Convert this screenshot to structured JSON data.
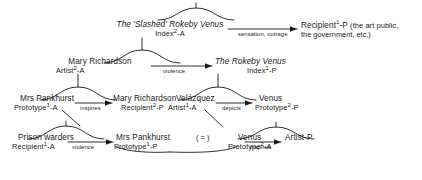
{
  "diagram": {
    "nodes": [
      {
        "id": "slashed-rokeby-venus",
        "title": "The 'Slashed' Rokeby Venus",
        "role_text": "Index",
        "role_sup": "2",
        "role_suffix": "-A",
        "role_full": "Index 2-A"
      },
      {
        "id": "recipient-1-p",
        "title": "Recipient",
        "title_sup": "1",
        "title_suffix": "-P",
        "title_full": "Recipient1-P",
        "note": "(the art public,",
        "note2": "the government, etc.)"
      },
      {
        "id": "mary-richardson-artist",
        "title": "Mary Richardson",
        "role_text": "Artist",
        "role_sup": "2",
        "role_suffix": "-A",
        "role_full": "Artist 2-A"
      },
      {
        "id": "rokeby-venus",
        "title": "The Rokeby Venus",
        "role_text": "Index",
        "role_sup": "1",
        "role_suffix": "-P",
        "role_full": "Index 1-P"
      },
      {
        "id": "mrs-pankhurst-prototype-1a",
        "title": "Mrs Pankhurst",
        "role_text": "Prototype",
        "role_sup": "1",
        "role_suffix": "-A",
        "role_full": "Prototype 1-A"
      },
      {
        "id": "mary-richardson-recipient",
        "title": "Mary Richardson",
        "role_text": "Recipient",
        "role_sup": "2",
        "role_suffix": "-P",
        "role_full": "Recipient 2-P"
      },
      {
        "id": "velazquez",
        "title": "Velázquez",
        "role_text": "Artist",
        "role_sup": "1",
        "role_suffix": "-A",
        "role_full": "Artist 1-A"
      },
      {
        "id": "venus-prototype-2p",
        "title": "Venus",
        "role_text": "Prototype",
        "role_sup": "2",
        "role_suffix": "-P",
        "role_full": "Prototype 2-P"
      },
      {
        "id": "prison-warders",
        "title": "Prison warders",
        "role_text": "Recipient",
        "role_sup": "1",
        "role_suffix": "-A",
        "role_full": "Recipient 1-A"
      },
      {
        "id": "mrs-pankhurst-prototype-1p",
        "title": "Mrs Pankhurst",
        "role_text": "Prototype",
        "role_sup": "1",
        "role_suffix": "-P",
        "role_full": "Prototype 1-P"
      },
      {
        "id": "venus-prototype-2a",
        "title": "Venus",
        "role_text": "Prototype",
        "role_sup": "2",
        "role_suffix": "-A",
        "role_full": "Prototype 2-A"
      },
      {
        "id": "artist-p",
        "title": "Artist-P",
        "role_text": "",
        "role_full": ""
      }
    ],
    "edges": [
      {
        "id": "edge-sensation-outrage",
        "label": "sensation, outrage",
        "from": "slashed-rokeby-venus",
        "to": "recipient-1-p"
      },
      {
        "id": "edge-violence-top",
        "label": "violence",
        "from": "mary-richardson-artist",
        "to": "rokeby-venus"
      },
      {
        "id": "edge-inspires-mid",
        "label": "inspires",
        "from": "mrs-pankhurst-prototype-1a",
        "to": "mary-richardson-recipient"
      },
      {
        "id": "edge-depicts",
        "label": "depicts",
        "from": "velazquez",
        "to": "venus-prototype-2p"
      },
      {
        "id": "edge-violence-bottom",
        "label": "violence",
        "from": "prison-warders",
        "to": "mrs-pankhurst-prototype-1p"
      },
      {
        "id": "edge-inspires-bottom",
        "label": "inspires",
        "from": "venus-prototype-2a",
        "to": "artist-p"
      }
    ],
    "equivalence": {
      "id": "equivalence-marker",
      "label": "( = )"
    },
    "colors": {
      "stroke": "#1a1a1a",
      "text": "#1a1a1a",
      "background": "#ffffff"
    }
  }
}
